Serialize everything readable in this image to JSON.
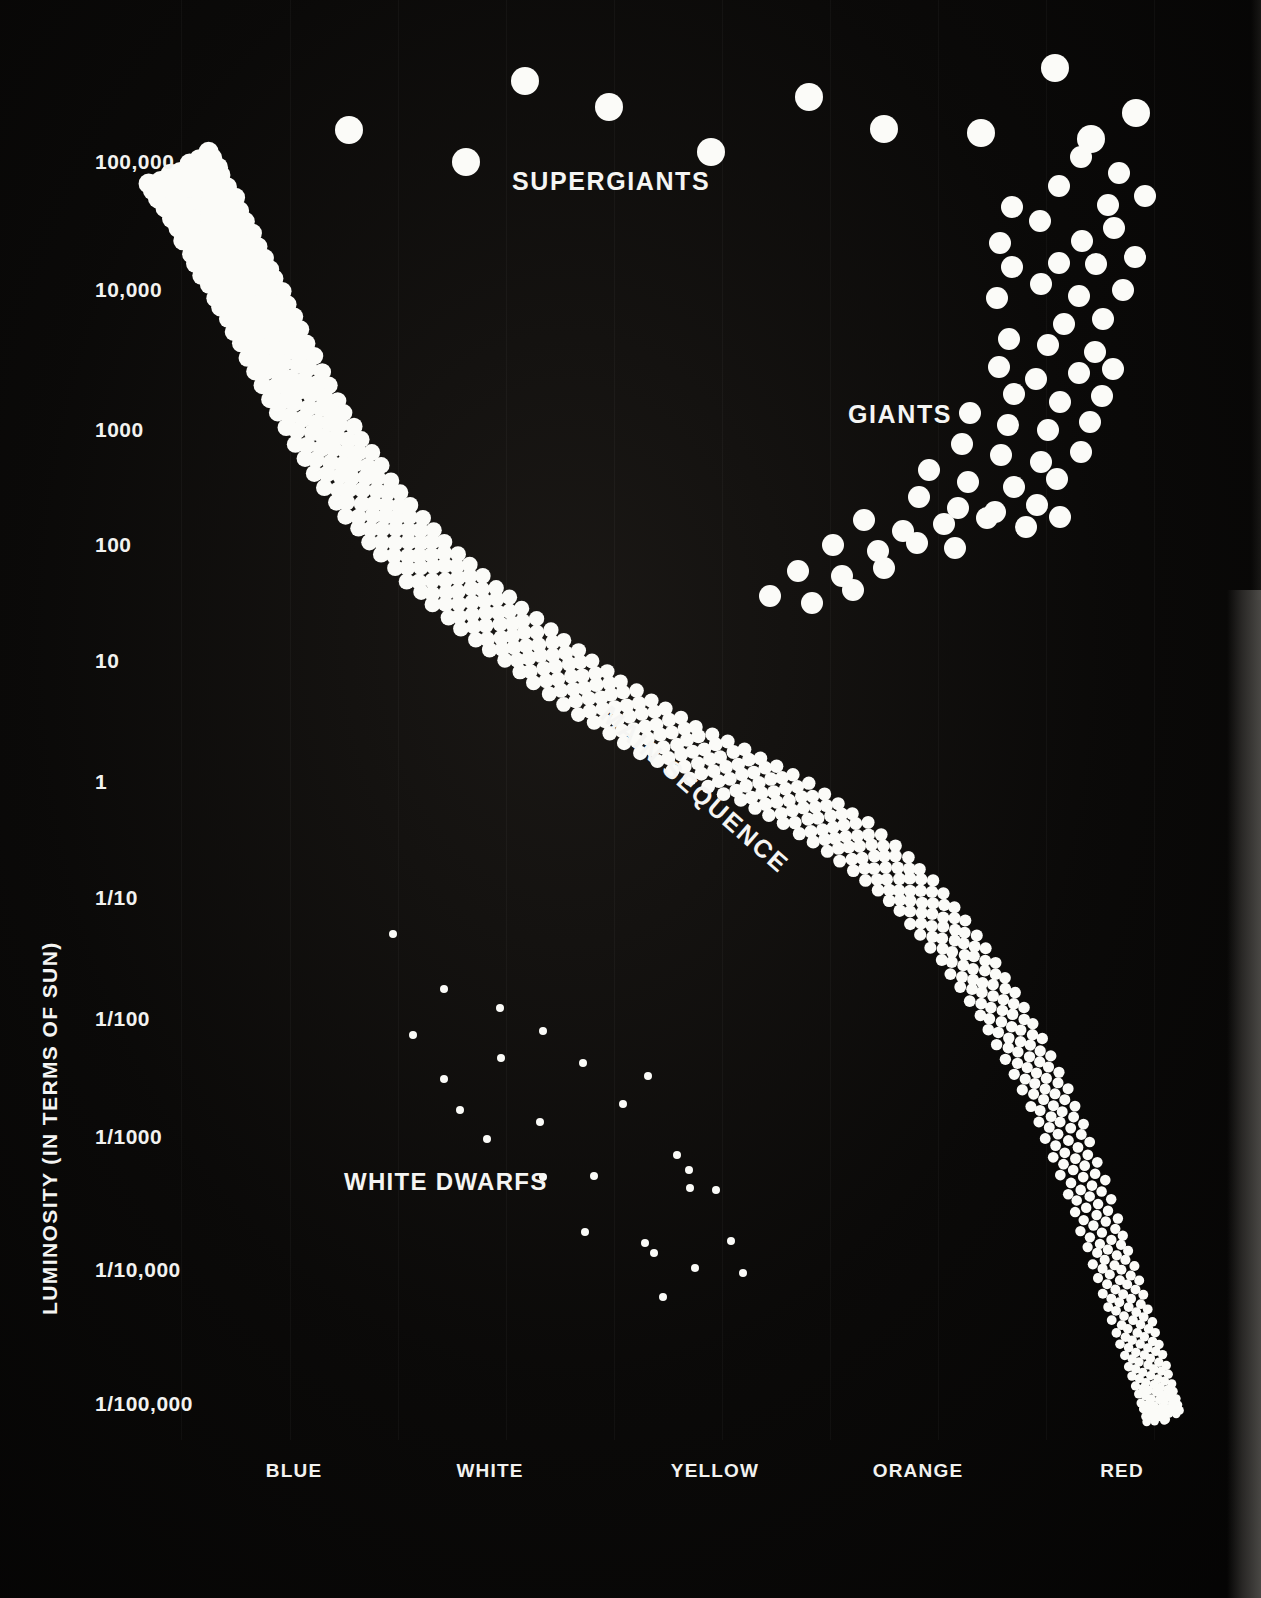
{
  "chart_data": {
    "type": "scatter",
    "xlabel": "",
    "ylabel": "LUMINOSITY   (IN TERMS OF SUN)",
    "grid": true,
    "legend": "none",
    "x_categories": [
      "BLUE",
      "WHITE",
      "YELLOW",
      "ORANGE",
      "RED"
    ],
    "y_ticks": [
      "100,000",
      "10,000",
      "1000",
      "100",
      "10",
      "1",
      "1/10",
      "1/100",
      "1/1000",
      "1/10,000",
      "1/100,000"
    ],
    "y_tick_values": [
      100000,
      10000,
      1000,
      100,
      10,
      1,
      0.1,
      0.01,
      0.001,
      0.0001,
      1e-05
    ],
    "annotations": [
      "SUPERGIANTS",
      "GIANTS",
      "MAIN SEQUENCE",
      "WHITE DWARFS"
    ],
    "series": [
      {
        "name": "SUPERGIANTS",
        "marker": "large-dot",
        "marker_px": 28,
        "points": [
          [
            349,
            130
          ],
          [
            466,
            162
          ],
          [
            525,
            81
          ],
          [
            609,
            107
          ],
          [
            711,
            152
          ],
          [
            809,
            97
          ],
          [
            884,
            129
          ],
          [
            981,
            133
          ],
          [
            1055,
            68
          ],
          [
            1091,
            139
          ],
          [
            1136,
            113
          ]
        ]
      },
      {
        "name": "GIANTS",
        "marker": "medium-dot",
        "marker_px": 22,
        "points": [
          [
            1081,
            157
          ],
          [
            1119,
            173
          ],
          [
            1059,
            186
          ],
          [
            1108,
            205
          ],
          [
            1012,
            207
          ],
          [
            1145,
            196
          ],
          [
            1040,
            221
          ],
          [
            1082,
            241
          ],
          [
            1114,
            228
          ],
          [
            1000,
            243
          ],
          [
            1059,
            263
          ],
          [
            1096,
            264
          ],
          [
            1135,
            257
          ],
          [
            1012,
            267
          ],
          [
            1041,
            284
          ],
          [
            1079,
            296
          ],
          [
            1123,
            290
          ],
          [
            997,
            298
          ],
          [
            1064,
            324
          ],
          [
            1103,
            319
          ],
          [
            1009,
            339
          ],
          [
            1048,
            345
          ],
          [
            1095,
            352
          ],
          [
            999,
            367
          ],
          [
            1036,
            379
          ],
          [
            1079,
            373
          ],
          [
            1113,
            369
          ],
          [
            1014,
            394
          ],
          [
            1060,
            402
          ],
          [
            1102,
            396
          ],
          [
            970,
            413
          ],
          [
            1008,
            425
          ],
          [
            1048,
            430
          ],
          [
            1090,
            422
          ],
          [
            962,
            444
          ],
          [
            1001,
            455
          ],
          [
            1041,
            462
          ],
          [
            1081,
            452
          ],
          [
            929,
            470
          ],
          [
            968,
            482
          ],
          [
            1014,
            487
          ],
          [
            1057,
            479
          ],
          [
            919,
            497
          ],
          [
            958,
            508
          ],
          [
            995,
            512
          ],
          [
            1037,
            505
          ],
          [
            864,
            520
          ],
          [
            903,
            531
          ],
          [
            944,
            524
          ],
          [
            987,
            518
          ],
          [
            1026,
            527
          ],
          [
            1060,
            517
          ],
          [
            833,
            545
          ],
          [
            878,
            551
          ],
          [
            917,
            543
          ],
          [
            955,
            548
          ],
          [
            798,
            571
          ],
          [
            842,
            576
          ],
          [
            884,
            568
          ],
          [
            770,
            596
          ],
          [
            812,
            603
          ],
          [
            853,
            590
          ]
        ]
      },
      {
        "name": "WHITE DWARFS",
        "marker": "small-dot",
        "marker_px": 8,
        "points": [
          [
            393,
            934
          ],
          [
            444,
            989
          ],
          [
            500,
            1008
          ],
          [
            413,
            1035
          ],
          [
            543,
            1031
          ],
          [
            501,
            1058
          ],
          [
            583,
            1063
          ],
          [
            444,
            1079
          ],
          [
            648,
            1076
          ],
          [
            460,
            1110
          ],
          [
            623,
            1104
          ],
          [
            540,
            1122
          ],
          [
            487,
            1139
          ],
          [
            677,
            1155
          ],
          [
            689,
            1170
          ],
          [
            543,
            1177
          ],
          [
            594,
            1176
          ],
          [
            690,
            1188
          ],
          [
            716,
            1190
          ],
          [
            585,
            1232
          ],
          [
            645,
            1243
          ],
          [
            654,
            1253
          ],
          [
            731,
            1241
          ],
          [
            695,
            1268
          ],
          [
            743,
            1273
          ],
          [
            663,
            1297
          ]
        ]
      },
      {
        "name": "MAIN SEQUENCE",
        "marker": "graded-dot",
        "description": "Dense band of dots running from upper-left (hot, luminous blue stars) to lower-right (cool, dim red stars), with marker size decreasing along the sequence.",
        "band_control_points": [
          [
            180,
            168
          ],
          [
            225,
            250
          ],
          [
            275,
            345
          ],
          [
            340,
            460
          ],
          [
            430,
            565
          ],
          [
            540,
            655
          ],
          [
            660,
            735
          ],
          [
            790,
            800
          ],
          [
            900,
            880
          ],
          [
            985,
            985
          ],
          [
            1055,
            1110
          ],
          [
            1110,
            1255
          ],
          [
            1145,
            1360
          ],
          [
            1165,
            1420
          ]
        ]
      }
    ]
  },
  "axis": {
    "y_title": "LUMINOSITY   (IN TERMS OF SUN)",
    "y_ticks": [
      {
        "label": "100,000",
        "top": 162
      },
      {
        "label": "10,000",
        "top": 290
      },
      {
        "label": "1000",
        "top": 430
      },
      {
        "label": "100",
        "top": 545
      },
      {
        "label": "10",
        "top": 661
      },
      {
        "label": "1",
        "top": 782
      },
      {
        "label": "1/10",
        "top": 898
      },
      {
        "label": "1/100",
        "top": 1019
      },
      {
        "label": "1/1000",
        "top": 1137
      },
      {
        "label": "1/10,000",
        "top": 1270
      },
      {
        "label": "1/100,000",
        "top": 1404
      }
    ],
    "x_ticks": [
      {
        "label": "BLUE",
        "left": 294
      },
      {
        "label": "WHITE",
        "left": 490
      },
      {
        "label": "YELLOW",
        "left": 715
      },
      {
        "label": "ORANGE",
        "left": 918
      },
      {
        "label": "RED",
        "left": 1122
      }
    ]
  },
  "labels": {
    "supergiants": "SUPERGIANTS",
    "giants": "GIANTS",
    "main_sequence": "MAIN SEQUENCE",
    "white_dwarfs": "WHITE DWARFS"
  },
  "colors": {
    "background": "#0a0908",
    "star": "#fbfbf8",
    "text": "#f4f4f2"
  }
}
